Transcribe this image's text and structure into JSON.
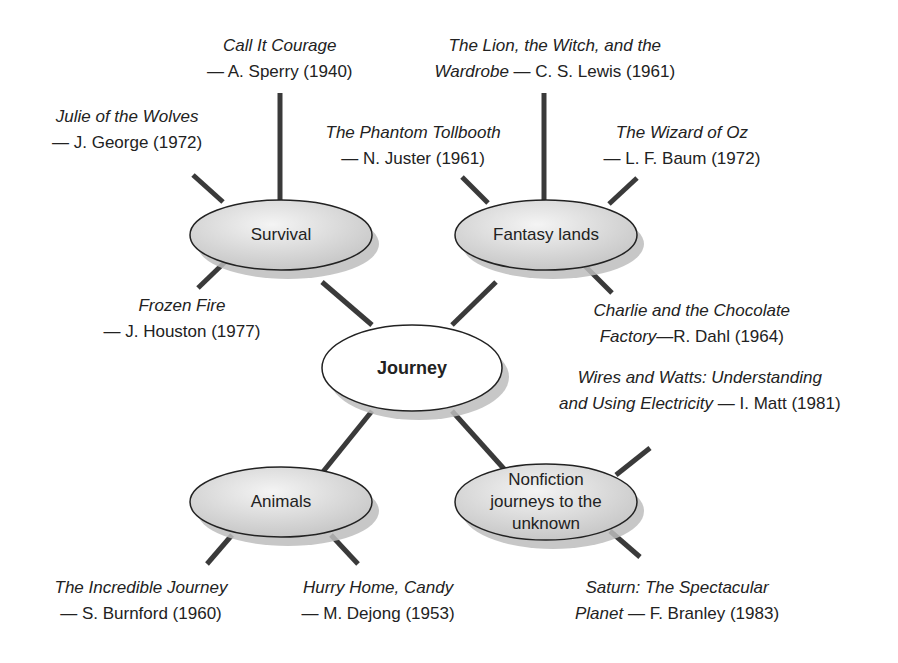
{
  "figure": {
    "title_fragment": "",
    "center": {
      "label": "Journey",
      "cx": 412,
      "cy": 368,
      "rx": 90,
      "ry": 43
    },
    "subtopics": [
      {
        "id": "survival",
        "label": "Survival",
        "cx": 281,
        "cy": 235,
        "rx": 91,
        "ry": 35
      },
      {
        "id": "fantasy",
        "label": "Fantasy lands",
        "cx": 546,
        "cy": 235,
        "rx": 91,
        "ry": 35
      },
      {
        "id": "animals",
        "label": "Animals",
        "cx": 281,
        "cy": 502,
        "rx": 91,
        "ry": 35
      },
      {
        "id": "nonfiction",
        "label": "Nonfiction journeys to the unknown",
        "lines": [
          "Nonfiction",
          "journeys to the",
          "unknown"
        ],
        "cx": 546,
        "cy": 502,
        "rx": 91,
        "ry": 38
      }
    ],
    "books": [
      {
        "subtopic": "survival",
        "title": "Call It Courage",
        "author": "A. Sperry",
        "year": "1940",
        "line1": "Call It Courage",
        "line2_title": "",
        "line2_rest": "— A. Sperry (1940)",
        "x": 280,
        "y": 33
      },
      {
        "subtopic": "survival",
        "title": "Julie of the Wolves",
        "author": "J. George",
        "year": "1972",
        "line1": "Julie of the Wolves",
        "line2_title": "",
        "line2_rest": "— J. George (1972)",
        "x": 127,
        "y": 104
      },
      {
        "subtopic": "survival",
        "title": "Frozen Fire",
        "author": "J. Houston",
        "year": "1977",
        "line1": "Frozen Fire",
        "line2_title": "",
        "line2_rest": "— J. Houston (1977)",
        "x": 182,
        "y": 293
      },
      {
        "subtopic": "fantasy",
        "title": "The Lion, the Witch, and the Wardrobe",
        "author": "C. S. Lewis",
        "year": "1961",
        "line1": "The Lion, the Witch, and the",
        "line2_title": "Wardrobe",
        "line2_rest": " — C. S. Lewis (1961)",
        "x": 555,
        "y": 33
      },
      {
        "subtopic": "fantasy",
        "title": "The Phantom Tollbooth",
        "author": "N. Juster",
        "year": "1961",
        "line1": "The Phantom Tollbooth",
        "line2_title": "",
        "line2_rest": "— N. Juster (1961)",
        "x": 413,
        "y": 120
      },
      {
        "subtopic": "fantasy",
        "title": "The Wizard of Oz",
        "author": "L. F. Baum",
        "year": "1972",
        "line1": "The Wizard of Oz",
        "line2_title": "",
        "line2_rest": "— L. F. Baum (1972)",
        "x": 682,
        "y": 120
      },
      {
        "subtopic": "fantasy",
        "title": "Charlie and the Chocolate Factory",
        "author": "R. Dahl",
        "year": "1964",
        "line1": "Charlie and the Chocolate",
        "line2_title": "Factory",
        "line2_rest": "—R. Dahl (1964)",
        "x": 692,
        "y": 298
      },
      {
        "subtopic": "nonfiction",
        "title": "Wires and Watts: Understanding and Using Electricity",
        "author": "I. Matt",
        "year": "1981",
        "line1": "Wires and Watts: Understanding",
        "line2_title": "and Using Electricity",
        "line2_rest": " — I. Matt (1981)",
        "x": 700,
        "y": 365
      },
      {
        "subtopic": "nonfiction",
        "title": "Saturn: The Spectacular Planet",
        "author": "F. Branley",
        "year": "1983",
        "line1": "Saturn: The Spectacular",
        "line2_title": "Planet",
        "line2_rest": " — F. Branley (1983)",
        "x": 677,
        "y": 575
      },
      {
        "subtopic": "animals",
        "title": "The Incredible Journey",
        "author": "S. Burnford",
        "year": "1960",
        "line1": "The Incredible Journey",
        "line2_title": "",
        "line2_rest": "— S. Burnford (1960)",
        "x": 141,
        "y": 575
      },
      {
        "subtopic": "animals",
        "title": "Hurry Home, Candy",
        "author": "M. Dejong",
        "year": "1953",
        "line1": "Hurry Home, Candy",
        "line2_title": "",
        "line2_rest": "— M. Dejong (1953)",
        "x": 378,
        "y": 575
      }
    ],
    "connectors": [
      [
        372,
        325,
        322,
        282
      ],
      [
        452,
        325,
        496,
        282
      ],
      [
        372,
        411,
        322,
        473
      ],
      [
        452,
        411,
        505,
        470
      ],
      [
        280,
        93,
        280,
        200
      ],
      [
        544,
        93,
        544,
        200
      ],
      [
        193,
        175,
        223,
        202
      ],
      [
        225,
        262,
        198,
        288
      ],
      [
        462,
        177,
        488,
        203
      ],
      [
        637,
        178,
        609,
        204
      ],
      [
        585,
        266,
        612,
        293
      ],
      [
        650,
        448,
        616,
        475
      ],
      [
        610,
        531,
        640,
        557
      ],
      [
        232,
        535,
        207,
        564
      ],
      [
        331,
        535,
        358,
        564
      ]
    ],
    "colors": {
      "line": "#3a3a3a",
      "ellipse_fill_light": "#f2f2f2",
      "ellipse_fill_dark": "#c9c9c9",
      "ellipse_stroke": "#222222",
      "shadow": "#bdbdbd",
      "center_fill": "#ffffff",
      "text": "#222222"
    }
  }
}
